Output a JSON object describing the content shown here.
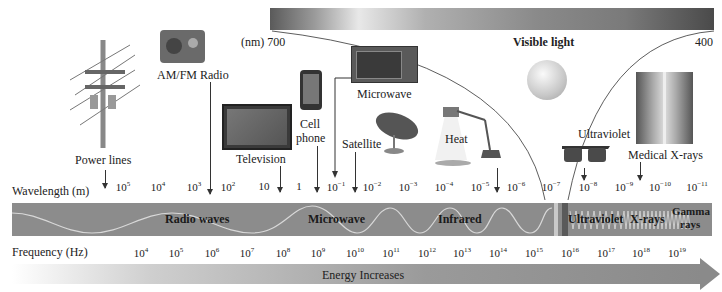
{
  "visible_light": {
    "label": "Visible light",
    "left_label": "(nm) 700",
    "right_label": "400"
  },
  "sources": [
    {
      "name": "power-lines",
      "label": "Power lines"
    },
    {
      "name": "am-fm-radio",
      "label": "AM/FM Radio"
    },
    {
      "name": "television",
      "label": "Television"
    },
    {
      "name": "cell-phone",
      "label_line1": "Cell",
      "label_line2": "phone"
    },
    {
      "name": "microwave",
      "label": "Microwave"
    },
    {
      "name": "satellite",
      "label": "Satellite"
    },
    {
      "name": "heat",
      "label": "Heat"
    },
    {
      "name": "ultraviolet",
      "label": "Ultraviolet"
    },
    {
      "name": "medical-x-rays",
      "label": "Medical X-rays"
    }
  ],
  "axis": {
    "wavelength_label": "Wavelength (m)",
    "frequency_label": "Frequency (Hz)",
    "wavelength_ticks": [
      "10^5",
      "10^4",
      "10^3",
      "10^2",
      "10",
      "1",
      "10^-1",
      "10^-2",
      "10^-3",
      "10^-4",
      "10^-5",
      "10^-6",
      "10^-7",
      "10^-8",
      "10^-9",
      "10^-10",
      "10^-11"
    ],
    "frequency_ticks": [
      "10^4",
      "10^5",
      "10^6",
      "10^7",
      "10^8",
      "10^9",
      "10^10",
      "10^11",
      "10^12",
      "10^13",
      "10^14",
      "10^15",
      "10^16",
      "10^17",
      "10^18",
      "10^19"
    ]
  },
  "bands": [
    {
      "label": "Radio waves"
    },
    {
      "label": "Microwave"
    },
    {
      "label": "Infrared"
    },
    {
      "label": "Ultraviolet"
    },
    {
      "label": "X-rays"
    },
    {
      "label_line1": "Gamma",
      "label_line2": "rays"
    }
  ],
  "energy": {
    "label": "Energy Increases"
  },
  "colors": {
    "band": "#8c8c8c",
    "wave": "#d8d8d8",
    "text": "#222222"
  }
}
